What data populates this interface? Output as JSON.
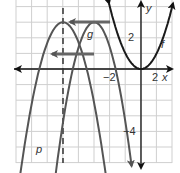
{
  "graph": {
    "axes": {
      "x_label": "x",
      "y_label": "y"
    },
    "tick_labels": {
      "x_neg2": "−2",
      "x_2": "2",
      "y_2": "2",
      "y_neg4": "−4"
    },
    "curves": [
      {
        "name": "f",
        "label": "f",
        "equation_hint": "y = x^2",
        "vertex": [
          0,
          0
        ],
        "color": "#1a1a1a"
      },
      {
        "name": "g",
        "label": "g",
        "vertex": [
          -5,
          3
        ],
        "opens": "down",
        "color": "#555555"
      },
      {
        "name": "p",
        "label": "p",
        "vertex": [
          -5,
          3
        ],
        "opens": "down",
        "color": "#555555"
      }
    ],
    "axis_of_symmetry": {
      "x": -5,
      "style": "dashed"
    },
    "translation_arrows": [
      {
        "from": [
          -2,
          3
        ],
        "to": [
          -5,
          3
        ]
      },
      {
        "from": [
          -3,
          1.6
        ],
        "to": [
          -5.4,
          1.6
        ]
      }
    ],
    "grid": {
      "x_min": -8,
      "x_max": 2,
      "y_min": -6,
      "y_max": 4,
      "step": 1
    }
  }
}
